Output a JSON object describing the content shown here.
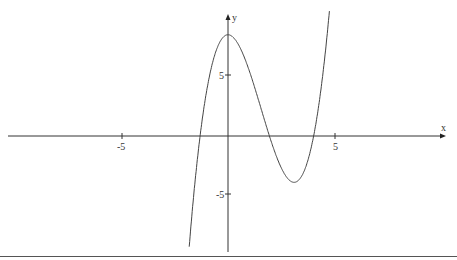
{
  "chart_data": {
    "type": "line",
    "title": "",
    "xlabel": "x",
    "ylabel": "y",
    "x_ticks": [
      "-5",
      "5"
    ],
    "y_ticks": [
      "5",
      "-5"
    ],
    "xlim": [
      -10.7,
      10.2
    ],
    "ylim": [
      -9.8,
      10
    ],
    "grid": false,
    "series": [
      {
        "name": "f(x)",
        "formula": "0.81x^3 - 3.77x^2 + 8.3",
        "points": [
          [
            -1.6,
            -9.8
          ],
          [
            -1.0,
            3.7
          ],
          [
            0,
            8.3
          ],
          [
            1,
            5.3
          ],
          [
            2,
            -0.3
          ],
          [
            3.1,
            -3.8
          ],
          [
            4,
            -1.2
          ],
          [
            4.7,
            3.7
          ],
          [
            5.0,
            8.3
          ],
          [
            4.85,
            5.9
          ]
        ],
        "key_points": {
          "local_max": [
            0,
            8.3
          ],
          "local_min": [
            3.1,
            -3.8
          ],
          "roots": [
            -1.3,
            1.9,
            4.2
          ]
        }
      }
    ],
    "colors": {
      "axis": "#333333",
      "curve": "#444444"
    }
  },
  "axes": {
    "x_label": "x",
    "y_label": "y",
    "tick_neg5_x": "-5",
    "tick_pos5_x": "5",
    "tick_pos5_y": "5",
    "tick_neg5_y": "-5"
  }
}
